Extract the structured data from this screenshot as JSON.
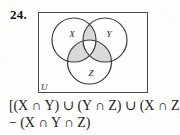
{
  "problem": {
    "number": "24."
  },
  "diagram": {
    "type": "venn-3-set",
    "universe_label": "U",
    "sets": [
      {
        "id": "X",
        "label": "X",
        "cx": 36,
        "cy": 28,
        "r": 22
      },
      {
        "id": "Y",
        "label": "Y",
        "cx": 67,
        "cy": 28,
        "r": 22
      },
      {
        "id": "Z",
        "label": "Z",
        "cx": 51.5,
        "cy": 50,
        "r": 22
      }
    ],
    "shaded_regions": [
      "X and Y only",
      "Y and Z only",
      "X and Z only"
    ],
    "unshaded_regions": [
      "X only",
      "Y only",
      "Z only",
      "X and Y and Z",
      "outside all sets"
    ],
    "colors": {
      "shade_fill": "#d9d9d9",
      "circle_stroke": "#3b3b3b",
      "box_stroke": "#4a4a4a",
      "background": "#fdfdfc",
      "text": "#1a1a1a"
    }
  },
  "expression": {
    "line1": "[(X ∩ Y) ∪ (Y ∩ Z) ∪ (X ∩ Z)]",
    "line2": "− (X ∩ Y ∩ Z)"
  }
}
